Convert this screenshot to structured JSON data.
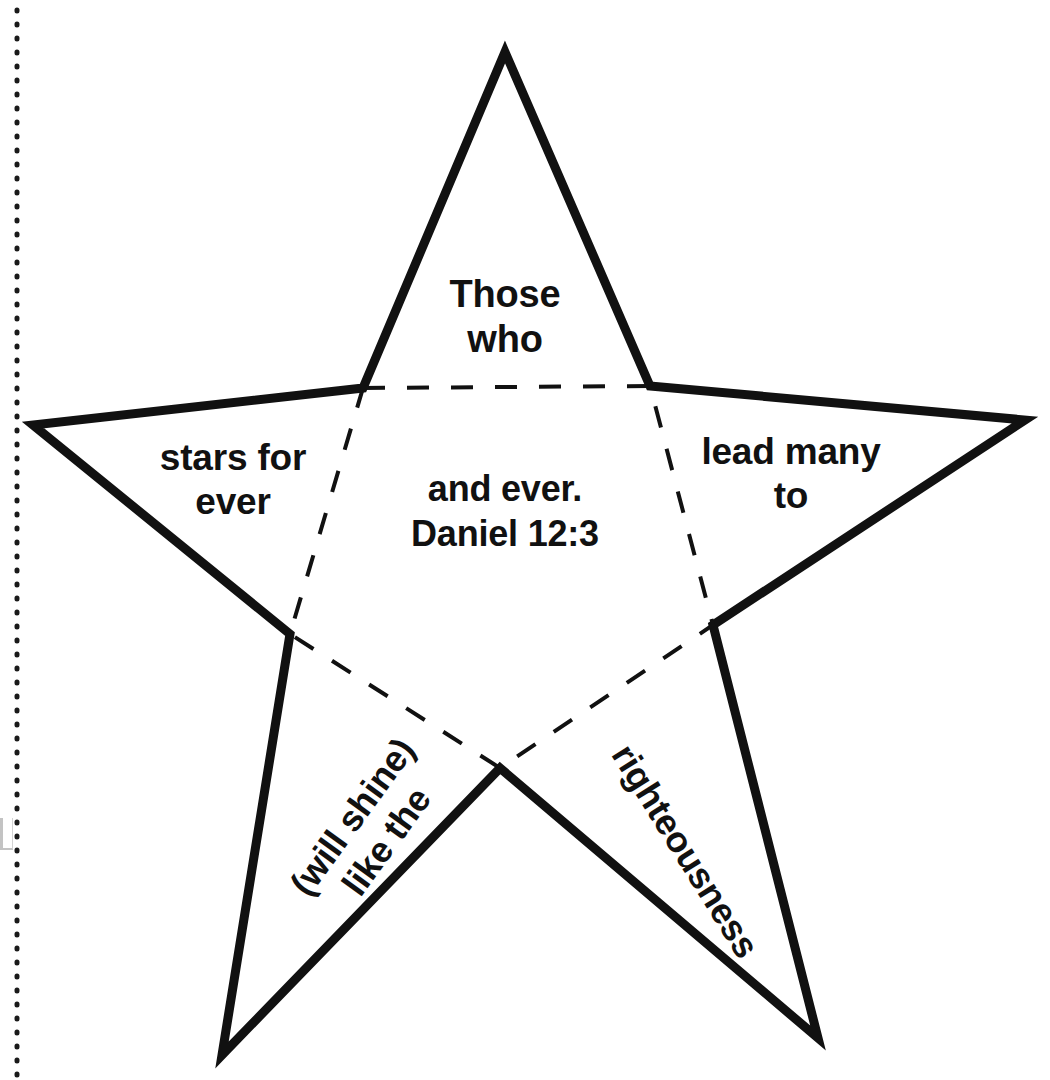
{
  "page": {
    "width": 1050,
    "height": 1080,
    "background_color": "#ffffff",
    "ink_color": "#111111"
  },
  "cut_line": {
    "name": "dotted-cut-line",
    "orientation": "vertical",
    "x": 17,
    "style": "dotted",
    "color": "#1a1a1a"
  },
  "star": {
    "stroke_color": "#111111",
    "stroke_width": 9,
    "fill": "#ffffff",
    "outer_points": [
      [
        505,
        52
      ],
      [
        1025,
        420
      ],
      [
        818,
        1038
      ],
      [
        222,
        1055
      ],
      [
        33,
        425
      ]
    ],
    "inner_points": [
      [
        650,
        386
      ],
      [
        713,
        625
      ],
      [
        500,
        768
      ],
      [
        290,
        634
      ],
      [
        363,
        388
      ]
    ],
    "fold_lines": {
      "name": "inner-pentagon-fold-lines",
      "style": "dashed",
      "stroke_width": 4,
      "dash": "22 22",
      "color": "#111111"
    }
  },
  "labels": {
    "top": "Those\nwho",
    "left": "stars for\never",
    "right": "lead many\nto",
    "center": "and ever.\nDaniel 12:3",
    "bottom_left": "(will shine)\nlike the",
    "bottom_right": "righteousness"
  },
  "full_verse": "Those who lead many to righteousness (will shine) like the stars for ever and ever. Daniel 12:3",
  "reference": "Daniel 12:3"
}
